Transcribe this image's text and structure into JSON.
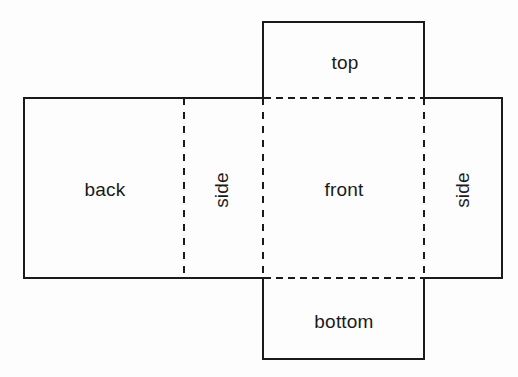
{
  "diagram": {
    "type": "net-diagram",
    "background_color": "#fdfdfd",
    "stroke_color": "#1a1a1a",
    "solid_stroke_width": 2,
    "dashed_stroke_width": 2,
    "dash_pattern_horizontal": "6 5",
    "dash_pattern_vertical": "7 7",
    "labels": {
      "back": "back",
      "side_left": "side",
      "front": "front",
      "side_right": "side",
      "top": "top",
      "bottom": "bottom"
    },
    "panels": [
      {
        "name": "back",
        "label": "back",
        "x": 24,
        "y": 98,
        "width": 160,
        "height": 180,
        "orientation": "horizontal"
      },
      {
        "name": "side-left",
        "label": "side",
        "x": 184,
        "y": 98,
        "width": 79,
        "height": 180,
        "orientation": "vertical"
      },
      {
        "name": "front",
        "label": "front",
        "x": 263,
        "y": 98,
        "width": 161,
        "height": 180,
        "orientation": "horizontal"
      },
      {
        "name": "side-right",
        "label": "side",
        "x": 424,
        "y": 98,
        "width": 78,
        "height": 180,
        "orientation": "vertical"
      },
      {
        "name": "top",
        "label": "top",
        "x": 263,
        "y": 22,
        "width": 161,
        "height": 76,
        "orientation": "horizontal"
      },
      {
        "name": "bottom",
        "label": "bottom",
        "x": 263,
        "y": 278,
        "width": 161,
        "height": 81,
        "orientation": "horizontal"
      }
    ],
    "fold_lines": [
      {
        "name": "fold-back-sideleft",
        "kind": "vertical",
        "x": 184,
        "y1": 98,
        "y2": 278
      },
      {
        "name": "fold-sideleft-front",
        "kind": "vertical",
        "x": 263,
        "y1": 98,
        "y2": 278
      },
      {
        "name": "fold-front-sideright",
        "kind": "vertical",
        "x": 424,
        "y1": 98,
        "y2": 278
      },
      {
        "name": "fold-top-front",
        "kind": "horizontal",
        "y": 98,
        "x1": 263,
        "x2": 424
      },
      {
        "name": "fold-front-bottom",
        "kind": "horizontal",
        "y": 278,
        "x1": 263,
        "x2": 424
      }
    ]
  }
}
